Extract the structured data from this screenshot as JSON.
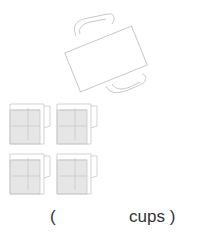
{
  "question": {
    "answer_prefix": "(",
    "answer_blank": "",
    "answer_unit": "cups )",
    "paren_close": ""
  },
  "figures": {
    "big_container": "tilted-pitcher-icon",
    "measuring_cups_count": 4
  },
  "colors": {
    "line": "#c8c8c8",
    "fill": "#e6e6e6"
  }
}
